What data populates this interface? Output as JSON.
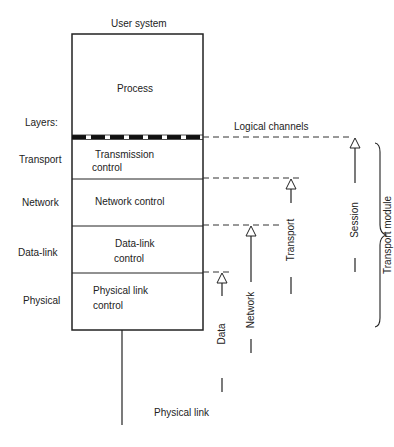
{
  "diagram": {
    "title": "User system",
    "layers_heading": "Layers:",
    "stack": [
      {
        "name": "process",
        "label": "Process"
      },
      {
        "name": "transmission-control",
        "label_line1": "Transmission",
        "label_line2": "control"
      },
      {
        "name": "network-control",
        "label": "Network control"
      },
      {
        "name": "data-link-control",
        "label_line1": "Data-link",
        "label_line2": "control"
      },
      {
        "name": "physical-link-control",
        "label_line1": "Physical link",
        "label_line2": "control"
      }
    ],
    "layers": [
      "Transport",
      "Network",
      "Data-link",
      "Physical"
    ],
    "logical_channels_label": "Logical channels",
    "channels": [
      "Data",
      "Network",
      "Transport",
      "Session"
    ],
    "module_label": "Transport module",
    "physical_link_label": "Physical link"
  }
}
